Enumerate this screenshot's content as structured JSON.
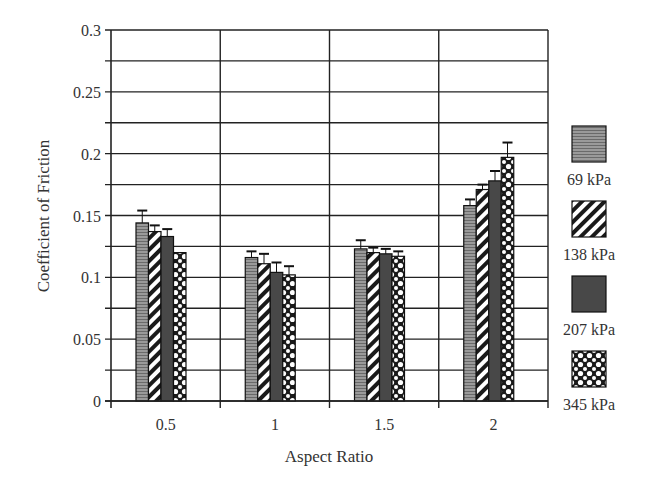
{
  "chart_data": {
    "type": "bar",
    "title": "",
    "xlabel": "Aspect Ratio",
    "ylabel": "Coefficient of Friction",
    "ylim": [
      0,
      0.3
    ],
    "yticks": [
      "0",
      "0.05",
      "0.1",
      "0.15",
      "0.2",
      "0.25",
      "0.3"
    ],
    "ytick_values": [
      0,
      0.05,
      0.1,
      0.15,
      0.2,
      0.25,
      0.3
    ],
    "minor_grid_step": 0.025,
    "grid": true,
    "legend_position": "right",
    "categories": [
      "0.5",
      "1",
      "1.5",
      "2"
    ],
    "series": [
      {
        "name": "69 kPa",
        "pattern": "horizontal-lines-light",
        "values": [
          0.144,
          0.116,
          0.123,
          0.158
        ],
        "errors": [
          0.01,
          0.005,
          0.007,
          0.005
        ]
      },
      {
        "name": "138 kPa",
        "pattern": "diagonal-stripes",
        "values": [
          0.137,
          0.111,
          0.12,
          0.171
        ],
        "errors": [
          0.005,
          0.008,
          0.004,
          0.004
        ]
      },
      {
        "name": "207 kPa",
        "pattern": "horizontal-lines-dark",
        "values": [
          0.133,
          0.104,
          0.119,
          0.178
        ],
        "errors": [
          0.006,
          0.008,
          0.004,
          0.008
        ]
      },
      {
        "name": "345 kPa",
        "pattern": "cross-hatch-dots",
        "values": [
          0.12,
          0.102,
          0.117,
          0.197
        ],
        "errors": [
          0.0,
          0.007,
          0.004,
          0.012
        ]
      }
    ]
  },
  "axes": {
    "x_title": "Aspect Ratio",
    "y_title": "Coefficient of Friction"
  },
  "legend": {
    "items": [
      "69 kPa",
      "138 kPa",
      "207 kPa",
      "345 kPa"
    ]
  }
}
